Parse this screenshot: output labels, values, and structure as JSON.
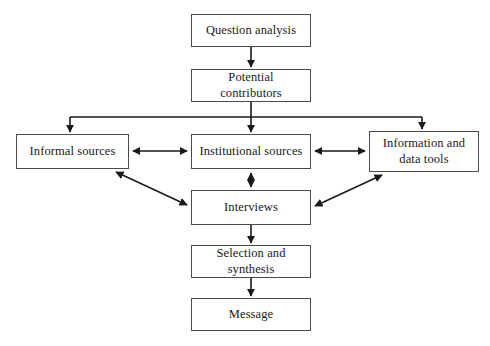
{
  "figure": {
    "type": "flowchart",
    "orientation": "top-down",
    "background_color": "#ffffff",
    "box_border_color": "#4a4a4a",
    "edge_color": "#1a1a1a",
    "text_color": "#1a1a1a"
  },
  "nodes": {
    "question_analysis": {
      "label": "Question analysis"
    },
    "potential_contributors": {
      "label": "Potential contributors"
    },
    "informal_sources": {
      "label": "Informal sources"
    },
    "institutional_sources": {
      "label": "Institutional sources"
    },
    "information_and_data_tools": {
      "label": "Information and\ndata tools"
    },
    "interviews": {
      "label": "Interviews"
    },
    "selection_and_synthesis": {
      "label": "Selection and synthesis"
    },
    "message": {
      "label": "Message"
    }
  },
  "edges": [
    {
      "from": "question_analysis",
      "to": "potential_contributors",
      "style": "straight-vertical",
      "arrows": "one-way"
    },
    {
      "from": "potential_contributors",
      "to": "informal_sources",
      "style": "orthogonal-branch",
      "arrows": "one-way"
    },
    {
      "from": "potential_contributors",
      "to": "institutional_sources",
      "style": "orthogonal-branch",
      "arrows": "one-way"
    },
    {
      "from": "potential_contributors",
      "to": "information_and_data_tools",
      "style": "orthogonal-branch",
      "arrows": "one-way"
    },
    {
      "from": "informal_sources",
      "to": "institutional_sources",
      "style": "straight-horizontal",
      "arrows": "two-way"
    },
    {
      "from": "institutional_sources",
      "to": "information_and_data_tools",
      "style": "straight-horizontal",
      "arrows": "two-way"
    },
    {
      "from": "institutional_sources",
      "to": "interviews",
      "style": "straight-vertical",
      "arrows": "two-way"
    },
    {
      "from": "informal_sources",
      "to": "interviews",
      "style": "diagonal",
      "arrows": "two-way"
    },
    {
      "from": "interviews",
      "to": "information_and_data_tools",
      "style": "diagonal",
      "arrows": "two-way"
    },
    {
      "from": "interviews",
      "to": "selection_and_synthesis",
      "style": "straight-vertical",
      "arrows": "one-way"
    },
    {
      "from": "selection_and_synthesis",
      "to": "message",
      "style": "straight-vertical",
      "arrows": "one-way"
    }
  ]
}
